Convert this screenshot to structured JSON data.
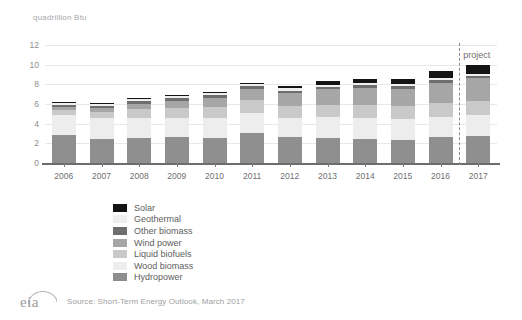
{
  "chart_data": {
    "type": "bar",
    "title": "quadrillion Btu",
    "subtitle": "",
    "xlabel": "",
    "ylabel": "quadrillion Btu",
    "ylim": [
      0,
      12
    ],
    "yticks": [
      0,
      2,
      4,
      6,
      8,
      10,
      12
    ],
    "grid": true,
    "stacked": true,
    "legend_position": "below-left",
    "categories": [
      "2006",
      "2007",
      "2008",
      "2009",
      "2010",
      "2011",
      "2012",
      "2013",
      "2014",
      "2015",
      "2016",
      "2017"
    ],
    "series": [
      {
        "name": "Hydropower",
        "color": "#8f8f8f",
        "values": [
          2.87,
          2.45,
          2.51,
          2.67,
          2.54,
          3.1,
          2.63,
          2.56,
          2.47,
          2.39,
          2.64,
          2.78
        ]
      },
      {
        "name": "Wood biomass",
        "color": "#ededed",
        "values": [
          2.0,
          2.08,
          2.05,
          1.94,
          2.0,
          2.03,
          1.96,
          2.07,
          2.14,
          2.05,
          2.06,
          2.08
        ]
      },
      {
        "name": "Liquid biofuels",
        "color": "#c9c9c9",
        "values": [
          0.52,
          0.69,
          0.92,
          1.02,
          1.18,
          1.25,
          1.2,
          1.27,
          1.3,
          1.32,
          1.38,
          1.42
        ]
      },
      {
        "name": "Wind power",
        "color": "#a6a6a6",
        "values": [
          0.26,
          0.34,
          0.55,
          0.72,
          0.92,
          1.17,
          1.34,
          1.6,
          1.73,
          1.78,
          2.1,
          2.33
        ]
      },
      {
        "name": "Other biomass",
        "color": "#6e6e6e",
        "values": [
          0.28,
          0.28,
          0.27,
          0.25,
          0.25,
          0.25,
          0.24,
          0.24,
          0.25,
          0.25,
          0.25,
          0.26
        ]
      },
      {
        "name": "Geothermal",
        "color": "#efefef",
        "values": [
          0.18,
          0.19,
          0.19,
          0.2,
          0.21,
          0.21,
          0.21,
          0.22,
          0.22,
          0.22,
          0.22,
          0.22
        ]
      },
      {
        "name": "Solar",
        "color": "#141414",
        "values": [
          0.07,
          0.08,
          0.09,
          0.1,
          0.13,
          0.17,
          0.24,
          0.34,
          0.45,
          0.54,
          0.7,
          0.92
        ]
      }
    ],
    "totals": [
      6.18,
      6.11,
      6.58,
      6.9,
      7.23,
      8.18,
      7.82,
      8.3,
      8.56,
      8.55,
      9.35,
      10.01
    ],
    "annotations": [
      {
        "name": "projection-divider",
        "label": "project",
        "after_category": "2016",
        "style": "dashed-vertical-line"
      }
    ]
  },
  "legend": {
    "items": [
      {
        "label": "Solar",
        "color": "#141414"
      },
      {
        "label": "Geothermal",
        "color": "#efefef"
      },
      {
        "label": "Other biomass",
        "color": "#6e6e6e"
      },
      {
        "label": "Wind power",
        "color": "#a6a6a6"
      },
      {
        "label": "Liquid biofuels",
        "color": "#c9c9c9"
      },
      {
        "label": "Wood biomass",
        "color": "#ededed"
      },
      {
        "label": "Hydropower",
        "color": "#8f8f8f"
      }
    ]
  },
  "footer": {
    "logo": "eia",
    "source": "Source: Short-Term Energy Outlook, March 2017"
  }
}
